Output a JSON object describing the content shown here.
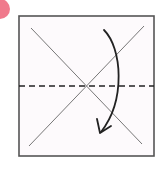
{
  "diagram": {
    "type": "origami-fold-step",
    "step_badge": {
      "color": "#f07a8c",
      "label": ""
    },
    "paper": {
      "fill": "#fdfafc",
      "border_color": "#555555",
      "x": 19,
      "y": 16,
      "width": 135,
      "height": 140
    },
    "crease_lines": [
      {
        "name": "diagonal-1",
        "x1": 31,
        "y1": 28,
        "x2": 142,
        "y2": 144,
        "style": "solid",
        "color": "#777777"
      },
      {
        "name": "diagonal-2",
        "x1": 29,
        "y1": 146,
        "x2": 144,
        "y2": 26,
        "style": "solid",
        "color": "#777777"
      }
    ],
    "fold_line": {
      "name": "valley-fold-horizontal",
      "x1": 19,
      "y1": 86,
      "x2": 154,
      "y2": 86,
      "style": "dashed",
      "color": "#222222"
    },
    "fold_arrow": {
      "direction": "top-to-bottom",
      "color": "#222222",
      "path": "M 104 30 C 122 48, 126 100, 101 132"
    }
  }
}
